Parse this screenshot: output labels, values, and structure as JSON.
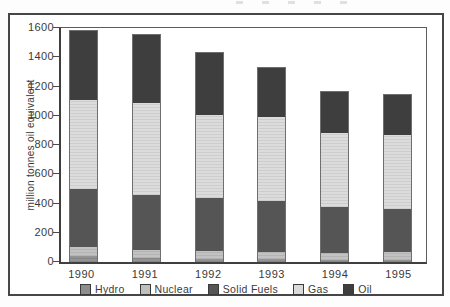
{
  "frame": {
    "border_color": "#464646"
  },
  "chart_data": {
    "type": "bar",
    "stacked": true,
    "title": "",
    "xlabel": "",
    "ylabel": "million tonnes oil equivalent",
    "categories": [
      "1990",
      "1991",
      "1992",
      "1993",
      "1994",
      "1995"
    ],
    "series": [
      {
        "name": "Hydro",
        "color": "#8d8d8d",
        "striped": true,
        "values": [
          40,
          30,
          20,
          20,
          15,
          15
        ]
      },
      {
        "name": "Nuclear",
        "color": "#bfbfbf",
        "striped": true,
        "values": [
          60,
          55,
          55,
          50,
          50,
          55
        ]
      },
      {
        "name": "Solid Fuels",
        "color": "#555555",
        "striped": false,
        "values": [
          400,
          370,
          365,
          345,
          310,
          295
        ]
      },
      {
        "name": "Gas",
        "color": "#dadada",
        "striped": true,
        "values": [
          610,
          635,
          565,
          580,
          510,
          505
        ]
      },
      {
        "name": "Oil",
        "color": "#3e3e3e",
        "striped": false,
        "values": [
          470,
          460,
          425,
          335,
          280,
          270
        ]
      }
    ],
    "ylim": [
      0,
      1600
    ],
    "yticks": [
      0,
      200,
      400,
      600,
      800,
      1000,
      1200,
      1400,
      1600
    ],
    "grid": false,
    "legend_position": "bottom"
  }
}
